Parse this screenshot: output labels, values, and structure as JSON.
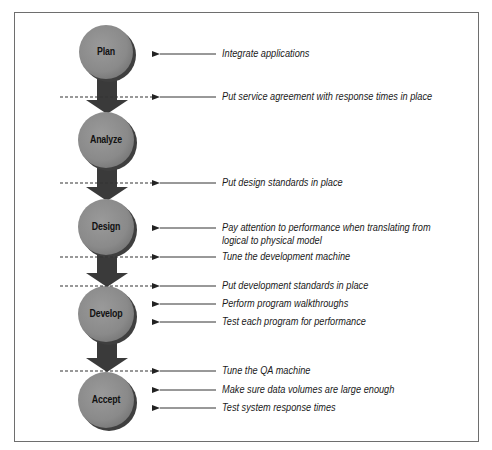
{
  "diagram": {
    "type": "process-flow",
    "stages": [
      {
        "id": "plan",
        "label": "Plan",
        "cy": 52
      },
      {
        "id": "analyze",
        "label": "Analyze",
        "cy": 140
      },
      {
        "id": "design",
        "label": "Design",
        "cy": 227
      },
      {
        "id": "develop",
        "label": "Develop",
        "cy": 314
      },
      {
        "id": "accept",
        "label": "Accept",
        "cy": 400
      }
    ],
    "transitions": [
      {
        "from": "plan",
        "to": "analyze",
        "checkpoint_y": 97
      },
      {
        "from": "analyze",
        "to": "design",
        "checkpoint_y": 183
      },
      {
        "from": "design",
        "to": "develop",
        "checkpoint_y": 257,
        "second_checkpoint_y": 286
      },
      {
        "from": "develop",
        "to": "accept",
        "checkpoint_y": 371
      }
    ],
    "notes": [
      {
        "text": "Integrate applications",
        "y": 54,
        "target": "plan",
        "dashed": false
      },
      {
        "text": "Put service agreement with response times in place",
        "y": 97,
        "target": "plan-analyze",
        "dashed": true
      },
      {
        "text": "Put design standards in place",
        "y": 183,
        "target": "analyze-design",
        "dashed": true
      },
      {
        "text": "Pay attention to performance when translating from",
        "text2": "logical to physical model",
        "y": 228,
        "target": "design",
        "dashed": false
      },
      {
        "text": "Tune the development machine",
        "y": 257,
        "target": "design-develop",
        "dashed": true
      },
      {
        "text": "Put development standards in place",
        "y": 286,
        "target": "design-develop",
        "dashed": true
      },
      {
        "text": "Perform program walkthroughs",
        "y": 304,
        "target": "develop",
        "dashed": false
      },
      {
        "text": "Test each program for performance",
        "y": 322,
        "target": "develop",
        "dashed": false
      },
      {
        "text": "Tune the QA machine",
        "y": 371,
        "target": "develop-accept",
        "dashed": true
      },
      {
        "text": "Make sure data volumes are large enough",
        "y": 390,
        "target": "accept",
        "dashed": false
      },
      {
        "text": "Test system response times",
        "y": 408,
        "target": "accept",
        "dashed": false
      }
    ],
    "colors": {
      "circle_fill": "#8c8c8c",
      "circle_shadow": "#3f3f3f",
      "arrow_fill": "#3a3a3a",
      "line": "#333333",
      "frame": "#6e6e6e"
    }
  }
}
